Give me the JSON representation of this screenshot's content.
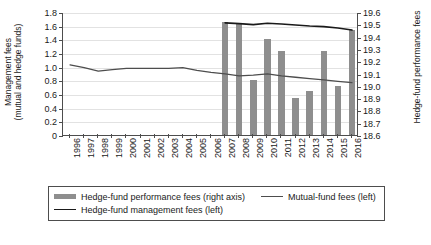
{
  "chart_data": {
    "type": "bar",
    "title": "",
    "xlabel": "",
    "ylabel": "Management fees\n(mutual and hedge funds)",
    "y2label": "Hedge-fund performance fees",
    "grid": true,
    "legend_position": "bottom",
    "categories": [
      "1996",
      "1997",
      "1998",
      "1999",
      "2000",
      "2001",
      "2002",
      "2003",
      "2004",
      "2005",
      "2006",
      "2007",
      "2008",
      "2009",
      "2010",
      "2011",
      "2012",
      "2013",
      "2014",
      "2015",
      "2016"
    ],
    "ylim": [
      0,
      1.8
    ],
    "yticks": [
      "0",
      "0.2",
      "0.4",
      "0.6",
      "0.8",
      "1.0",
      "1.2",
      "1.4",
      "1.6",
      "1.8"
    ],
    "y2lim": [
      18.6,
      19.6
    ],
    "y2ticks": [
      "18.6",
      "18.7",
      "18.8",
      "18.9",
      "19.0",
      "19.1",
      "19.2",
      "19.3",
      "19.4",
      "19.5",
      "19.6"
    ],
    "series": [
      {
        "name": "Hedge-fund performance fees (right axis)",
        "type": "bar",
        "axis": "right",
        "color": "#8e8e8e",
        "values": [
          null,
          null,
          null,
          null,
          null,
          null,
          null,
          null,
          null,
          null,
          null,
          19.52,
          19.5,
          19.05,
          19.38,
          19.28,
          18.9,
          18.96,
          19.28,
          19.0,
          19.45
        ]
      },
      {
        "name": "Mutual-fund fees (left)",
        "type": "line",
        "axis": "left",
        "color": "#4d4d4d",
        "values": [
          1.04,
          1.0,
          0.95,
          0.97,
          0.99,
          0.99,
          0.99,
          0.99,
          1.0,
          0.96,
          0.93,
          0.91,
          0.88,
          0.89,
          0.91,
          0.88,
          0.86,
          0.84,
          0.82,
          0.8,
          0.78
        ]
      },
      {
        "name": "Hedge-fund management fees (left)",
        "type": "line",
        "axis": "left",
        "color": "#1a1a1a",
        "values": [
          null,
          null,
          null,
          null,
          null,
          null,
          null,
          null,
          null,
          null,
          null,
          1.655,
          1.645,
          1.63,
          1.65,
          1.64,
          1.625,
          1.61,
          1.6,
          1.58,
          1.55
        ]
      }
    ]
  },
  "legend": {
    "items": [
      {
        "label": "Hedge-fund performance fees (right axis)",
        "marker": "bar-swatch-icon"
      },
      {
        "label": "Mutual-fund fees (left)",
        "marker": "line-swatch-icon"
      },
      {
        "label": "Hedge-fund management fees (left)",
        "marker": "line-swatch-dark-icon"
      }
    ]
  },
  "caption": ""
}
